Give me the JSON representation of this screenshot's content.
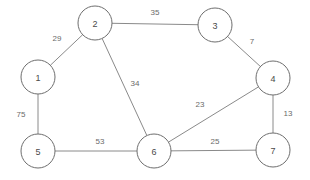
{
  "diagram": {
    "type": "node-link-graph",
    "background_color": "#ffffff",
    "node_stroke_color": "#6e6e6e",
    "node_fill_color": "#ffffff",
    "edge_color": "#8a8a8a",
    "label_color": "#4a4a4a",
    "weight_color": "#6a6a6a",
    "node_radius": 17,
    "width": 310,
    "height": 180
  },
  "chart_data": {
    "type": "graph",
    "directed": false,
    "weighted": true,
    "node_count": 7,
    "edge_count": 9,
    "nodes": [
      {
        "id": "1",
        "label": "1",
        "x": 38,
        "y": 77
      },
      {
        "id": "2",
        "label": "2",
        "x": 95,
        "y": 23
      },
      {
        "id": "3",
        "label": "3",
        "x": 215,
        "y": 25
      },
      {
        "id": "4",
        "label": "4",
        "x": 273,
        "y": 78
      },
      {
        "id": "5",
        "label": "5",
        "x": 38,
        "y": 151
      },
      {
        "id": "6",
        "label": "6",
        "x": 154,
        "y": 151
      },
      {
        "id": "7",
        "label": "7",
        "x": 273,
        "y": 150
      }
    ],
    "edges": [
      {
        "source": "1",
        "target": "2",
        "weight": 29,
        "label": "29",
        "lx": 57,
        "ly": 38
      },
      {
        "source": "2",
        "target": "3",
        "weight": 35,
        "label": "35",
        "lx": 155,
        "ly": 12
      },
      {
        "source": "2",
        "target": "6",
        "weight": 34,
        "label": "34",
        "lx": 135,
        "ly": 83
      },
      {
        "source": "3",
        "target": "4",
        "weight": 7,
        "label": "7",
        "lx": 252,
        "ly": 41
      },
      {
        "source": "4",
        "target": "6",
        "weight": 23,
        "label": "23",
        "lx": 200,
        "ly": 104
      },
      {
        "source": "4",
        "target": "7",
        "weight": 13,
        "label": "13",
        "lx": 288,
        "ly": 113
      },
      {
        "source": "1",
        "target": "5",
        "weight": 75,
        "label": "75",
        "lx": 21,
        "ly": 114
      },
      {
        "source": "5",
        "target": "6",
        "weight": 53,
        "label": "53",
        "lx": 100,
        "ly": 141
      },
      {
        "source": "6",
        "target": "7",
        "weight": 25,
        "label": "25",
        "lx": 215,
        "ly": 141
      }
    ]
  }
}
